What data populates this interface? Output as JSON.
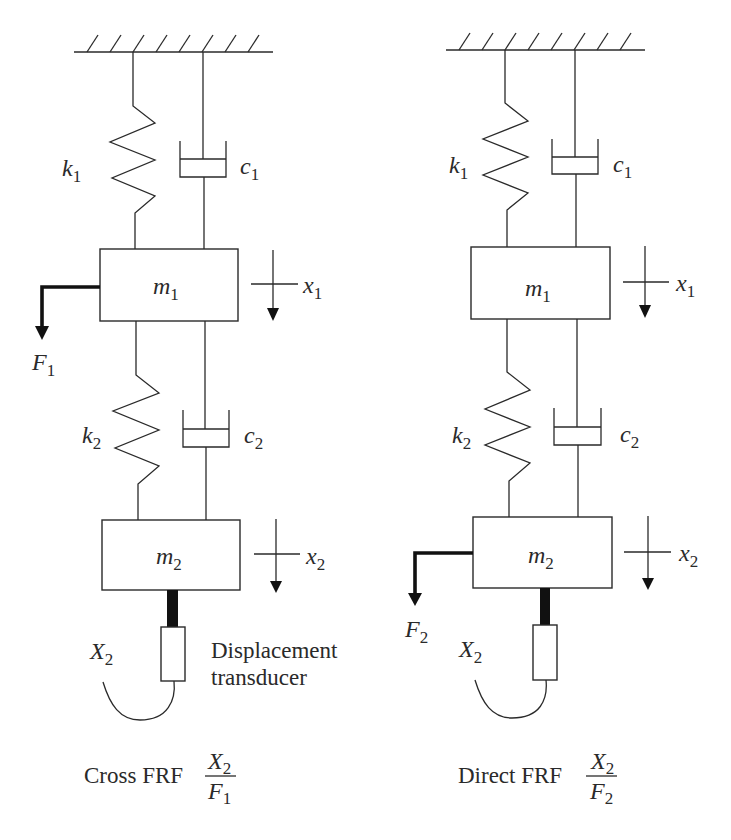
{
  "figure": {
    "left_panel": {
      "caption_text": "Cross FRF",
      "fraction": {
        "numerator": "X",
        "numerator_sub": "2",
        "denominator": "F",
        "denominator_sub": "1"
      },
      "labels": {
        "k1": {
          "base": "k",
          "sub": "1"
        },
        "c1": {
          "base": "c",
          "sub": "1"
        },
        "m1": {
          "base": "m",
          "sub": "1"
        },
        "x1": {
          "base": "x",
          "sub": "1"
        },
        "F1": {
          "base": "F",
          "sub": "1"
        },
        "k2": {
          "base": "k",
          "sub": "2"
        },
        "c2": {
          "base": "c",
          "sub": "2"
        },
        "m2": {
          "base": "m",
          "sub": "2"
        },
        "x2": {
          "base": "x",
          "sub": "2"
        },
        "X2": {
          "base": "X",
          "sub": "2"
        }
      },
      "transducer_label_line1": "Displacement",
      "transducer_label_line2": "transducer"
    },
    "right_panel": {
      "caption_text": "Direct FRF",
      "fraction": {
        "numerator": "X",
        "numerator_sub": "2",
        "denominator": "F",
        "denominator_sub": "2"
      },
      "labels": {
        "k1": {
          "base": "k",
          "sub": "1"
        },
        "c1": {
          "base": "c",
          "sub": "1"
        },
        "m1": {
          "base": "m",
          "sub": "1"
        },
        "x1": {
          "base": "x",
          "sub": "1"
        },
        "k2": {
          "base": "k",
          "sub": "2"
        },
        "c2": {
          "base": "c",
          "sub": "2"
        },
        "m2": {
          "base": "m",
          "sub": "2"
        },
        "x2": {
          "base": "x",
          "sub": "2"
        },
        "F2": {
          "base": "F",
          "sub": "2"
        },
        "X2": {
          "base": "X",
          "sub": "2"
        }
      }
    }
  }
}
